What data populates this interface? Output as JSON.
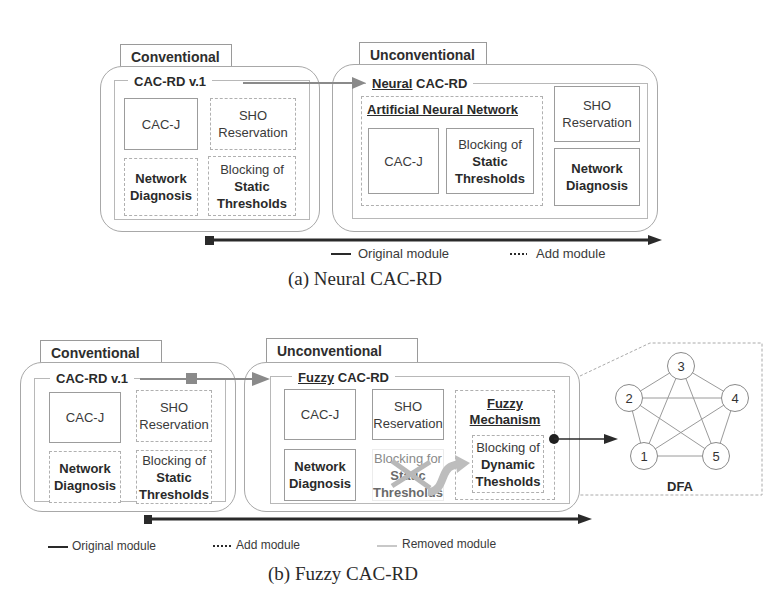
{
  "figure_a": {
    "caption": "(a)  Neural CAC-RD",
    "conventional": {
      "tab_label": "Conventional",
      "title": "CAC-RD v.1",
      "modules": [
        {
          "lines": [
            "CAC-J"
          ],
          "style": "solid"
        },
        {
          "lines": [
            "SHO",
            "Reservation"
          ],
          "style": "dotted"
        },
        {
          "lines": [
            "Network",
            "Diagnosis"
          ],
          "style": "dotted",
          "bold": true
        },
        {
          "line1": "Blocking of",
          "line2": "Static",
          "line3": "Thresholds",
          "style": "dotted"
        }
      ]
    },
    "unconventional": {
      "tab_label": "Unconventional",
      "title_underlined": "Neural",
      "title_rest": " CAC-RD",
      "ann_group_label": "Artificial Neural Network",
      "modules": [
        {
          "lines": [
            "CAC-J"
          ],
          "style": "solid"
        },
        {
          "line1": "Blocking of",
          "line2": "Static",
          "line3": "Thresholds",
          "style": "solid"
        },
        {
          "lines": [
            "SHO",
            "Reservation"
          ],
          "style": "solid"
        },
        {
          "lines": [
            "Network",
            "Diagnosis"
          ],
          "style": "solid",
          "bold": true
        }
      ]
    },
    "legend": {
      "original": "Original module",
      "add": "Add module"
    }
  },
  "figure_b": {
    "caption": "(b)  Fuzzy CAC-RD",
    "conventional": {
      "tab_label": "Conventional",
      "title": "CAC-RD v.1",
      "modules": [
        {
          "lines": [
            "CAC-J"
          ],
          "style": "solid"
        },
        {
          "lines": [
            "SHO",
            "Reservation"
          ],
          "style": "dotted"
        },
        {
          "lines": [
            "Network",
            "Diagnosis"
          ],
          "style": "dotted",
          "bold": true
        },
        {
          "line1": "Blocking of",
          "line2": "Static",
          "line3": "Thresholds",
          "style": "dotted"
        }
      ]
    },
    "unconventional": {
      "tab_label": "Unconventional",
      "title_underlined": "Fuzzy",
      "title_rest": " CAC-RD",
      "modules": [
        {
          "lines": [
            "CAC-J"
          ],
          "style": "solid"
        },
        {
          "lines": [
            "SHO",
            "Reservation"
          ],
          "style": "solid"
        },
        {
          "lines": [
            "Network",
            "Diagnosis"
          ],
          "style": "solid",
          "bold": true
        },
        {
          "line1": "Blocking for",
          "line2": "Static",
          "line3": "Thresholds",
          "style": "removed"
        }
      ],
      "fuzzy_mechanism": {
        "label_line1": "Fuzzy",
        "label_line2": "Mechanism",
        "module": {
          "line1": "Blocking of",
          "line2": "Dynamic",
          "line3": "Thesholds"
        }
      }
    },
    "dfa": {
      "label": "DFA",
      "nodes": [
        "1",
        "2",
        "3",
        "4",
        "5"
      ]
    },
    "legend": {
      "original": "Original module",
      "add": "Add module",
      "removed": "Removed module"
    }
  },
  "colors": {
    "line_dark": "#2a2a2a",
    "arrow_gray": "#8a8a8a",
    "removed_gray": "#c8c8c8",
    "border_gray": "#a8a8a8"
  }
}
